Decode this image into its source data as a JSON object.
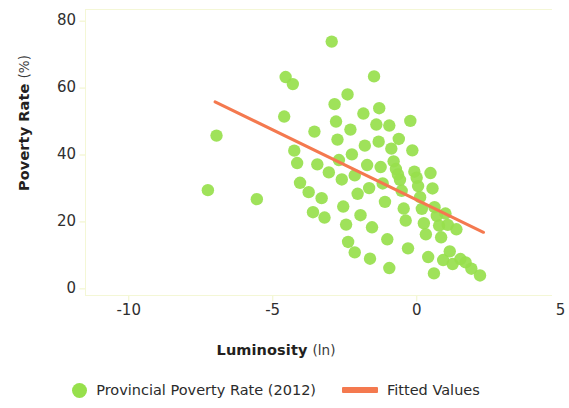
{
  "chart_data": {
    "type": "scatter",
    "title": "",
    "xlabel": "Luminosity",
    "xlabel_unit": "(ln)",
    "ylabel": "Poverty Rate",
    "ylabel_unit": "(%)",
    "xlim": [
      -11.5,
      4.7
    ],
    "ylim": [
      -2.0,
      83.5
    ],
    "xticks": [
      -10,
      -5,
      0,
      5
    ],
    "xtick_labels": [
      "-10",
      "-5",
      "0",
      "5"
    ],
    "yticks": [
      0,
      20,
      40,
      60,
      80
    ],
    "ytick_labels": [
      "0",
      "20",
      "40",
      "60",
      "80"
    ],
    "grid": false,
    "legend_position": "below-axes",
    "colors": {
      "marker": "#97e04c",
      "fit_line": "#f4794f",
      "axis": "#f4f7d6",
      "text": "#2b2b2b"
    },
    "series": [
      {
        "name": "Provincial Poverty Rate (2012)",
        "type": "scatter",
        "color": "#97e04c",
        "marker": "circle",
        "points": [
          [
            -6.95,
            45.8
          ],
          [
            -7.25,
            29.5
          ],
          [
            -5.55,
            26.8
          ],
          [
            -4.55,
            63.3
          ],
          [
            -4.3,
            61.2
          ],
          [
            -4.6,
            51.5
          ],
          [
            -4.25,
            41.3
          ],
          [
            -4.15,
            37.6
          ],
          [
            -4.05,
            31.7
          ],
          [
            -3.75,
            28.9
          ],
          [
            -3.55,
            47.0
          ],
          [
            -3.45,
            37.2
          ],
          [
            -3.3,
            27.1
          ],
          [
            -3.2,
            21.3
          ],
          [
            -2.95,
            73.9
          ],
          [
            -2.85,
            55.2
          ],
          [
            -2.8,
            50.0
          ],
          [
            -2.75,
            44.6
          ],
          [
            -2.7,
            38.5
          ],
          [
            -2.6,
            32.7
          ],
          [
            -2.55,
            24.6
          ],
          [
            -2.45,
            19.2
          ],
          [
            -2.4,
            58.1
          ],
          [
            -2.3,
            47.6
          ],
          [
            -2.25,
            40.2
          ],
          [
            -2.15,
            33.9
          ],
          [
            -2.05,
            28.4
          ],
          [
            -1.95,
            22.0
          ],
          [
            -1.85,
            52.4
          ],
          [
            -1.8,
            42.8
          ],
          [
            -1.72,
            37.0
          ],
          [
            -1.65,
            30.1
          ],
          [
            -1.55,
            18.4
          ],
          [
            -1.48,
            63.5
          ],
          [
            -1.4,
            49.1
          ],
          [
            -1.32,
            44.0
          ],
          [
            -1.25,
            36.4
          ],
          [
            -1.18,
            31.5
          ],
          [
            -1.1,
            26.0
          ],
          [
            -1.02,
            14.8
          ],
          [
            -0.95,
            48.8
          ],
          [
            -0.88,
            41.9
          ],
          [
            -0.8,
            38.1
          ],
          [
            -0.72,
            35.8
          ],
          [
            -0.65,
            34.2
          ],
          [
            -0.58,
            32.6
          ],
          [
            -0.52,
            29.3
          ],
          [
            -0.45,
            24.0
          ],
          [
            -0.38,
            20.4
          ],
          [
            -0.3,
            12.1
          ],
          [
            -0.22,
            50.2
          ],
          [
            -0.15,
            41.4
          ],
          [
            -0.08,
            35.0
          ],
          [
            0.0,
            33.2
          ],
          [
            0.05,
            30.7
          ],
          [
            0.12,
            27.4
          ],
          [
            0.18,
            23.9
          ],
          [
            0.25,
            19.6
          ],
          [
            0.32,
            16.3
          ],
          [
            0.4,
            9.5
          ],
          [
            0.48,
            34.6
          ],
          [
            0.55,
            30.0
          ],
          [
            0.62,
            24.4
          ],
          [
            0.7,
            21.8
          ],
          [
            0.78,
            18.9
          ],
          [
            0.85,
            15.4
          ],
          [
            0.92,
            8.6
          ],
          [
            1.0,
            22.5
          ],
          [
            1.08,
            19.1
          ],
          [
            1.15,
            11.2
          ],
          [
            1.25,
            7.4
          ],
          [
            1.38,
            17.8
          ],
          [
            1.52,
            8.9
          ],
          [
            1.7,
            7.9
          ],
          [
            1.9,
            6.0
          ],
          [
            2.2,
            4.0
          ],
          [
            -0.95,
            6.2
          ],
          [
            -1.62,
            9.0
          ],
          [
            -2.15,
            10.9
          ],
          [
            0.6,
            4.6
          ],
          [
            -3.05,
            34.8
          ],
          [
            -3.6,
            22.9
          ],
          [
            -2.38,
            14.0
          ],
          [
            -1.3,
            54.0
          ],
          [
            -0.62,
            44.8
          ]
        ]
      },
      {
        "name": "Fitted Values",
        "type": "line",
        "color": "#f4794f",
        "x_start": -7.0,
        "y_start": 55.9,
        "x_end": 2.32,
        "y_end": 16.9
      }
    ]
  },
  "axis": {
    "ylabel_main": "Poverty Rate",
    "ylabel_unit": "(%)",
    "xlabel_main": "Luminosity",
    "xlabel_unit": "(ln)"
  },
  "legend": {
    "items": [
      {
        "label": "Provincial Poverty Rate (2012)",
        "marker": "circle-marker",
        "color": "#97e04c"
      },
      {
        "label": "Fitted Values",
        "marker": "line-marker",
        "color": "#f4794f"
      }
    ]
  }
}
